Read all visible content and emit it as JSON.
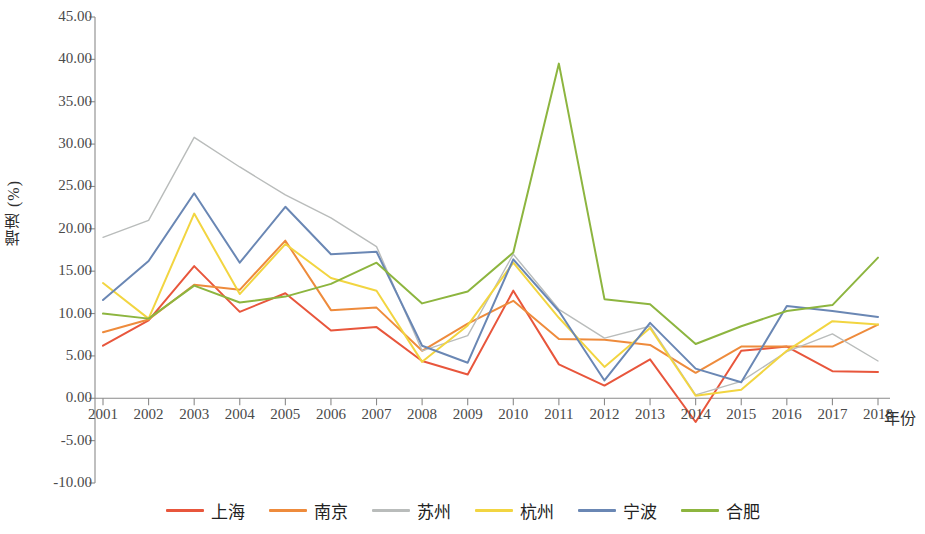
{
  "chart_data": {
    "type": "line",
    "title": "",
    "xlabel": "年份",
    "ylabel": "增速 (%)",
    "grid": false,
    "legend_position": "bottom",
    "xlim": [
      2001,
      2018
    ],
    "ylim": [
      -10,
      45
    ],
    "ytick_step": 5,
    "yticks": [
      "45.00",
      "40.00",
      "35.00",
      "30.00",
      "25.00",
      "20.00",
      "15.00",
      "10.00",
      "5.00",
      "0.00",
      "-5.00",
      "-10.00"
    ],
    "ytick_values": [
      45,
      40,
      35,
      30,
      25,
      20,
      15,
      10,
      5,
      0,
      -5,
      -10
    ],
    "categories": [
      "2001",
      "2002",
      "2003",
      "2004",
      "2005",
      "2006",
      "2007",
      "2008",
      "2009",
      "2010",
      "2011",
      "2012",
      "2013",
      "2014",
      "2015",
      "2016",
      "2017",
      "2018"
    ],
    "x": [
      2001,
      2002,
      2003,
      2004,
      2005,
      2006,
      2007,
      2008,
      2009,
      2010,
      2011,
      2012,
      2013,
      2014,
      2015,
      2016,
      2017,
      2018
    ],
    "series": [
      {
        "name": "上海",
        "color": "#E8563C",
        "values": [
          6.2,
          9.2,
          15.6,
          10.2,
          12.4,
          8.0,
          8.4,
          4.4,
          2.8,
          12.7,
          4.0,
          1.5,
          4.6,
          -2.8,
          5.6,
          6.1,
          3.2,
          3.1
        ]
      },
      {
        "name": "南京",
        "color": "#EE8B3C",
        "values": [
          7.8,
          9.3,
          13.4,
          12.8,
          18.6,
          10.4,
          10.7,
          5.6,
          8.8,
          11.5,
          7.0,
          6.9,
          6.3,
          3.0,
          6.1,
          6.1,
          6.1,
          8.7
        ]
      },
      {
        "name": "苏州",
        "color": "#B9BCBB",
        "values": [
          19.0,
          21.0,
          30.8,
          27.3,
          24.0,
          21.3,
          17.9,
          5.6,
          7.4,
          17.0,
          10.5,
          7.1,
          8.5,
          0.4,
          2.0,
          5.5,
          7.6,
          4.4
        ]
      },
      {
        "name": "杭州",
        "color": "#F2D541",
        "values": [
          13.6,
          9.4,
          21.8,
          12.3,
          18.2,
          14.2,
          12.7,
          4.3,
          8.6,
          16.0,
          9.5,
          3.7,
          8.3,
          0.3,
          1.0,
          5.6,
          9.1,
          8.7
        ]
      },
      {
        "name": "宁波",
        "color": "#6A87B4",
        "values": [
          11.6,
          16.2,
          24.2,
          16.0,
          22.6,
          17.0,
          17.3,
          6.2,
          4.2,
          16.4,
          10.3,
          2.1,
          8.9,
          3.5,
          1.9,
          10.9,
          10.3,
          9.6
        ]
      },
      {
        "name": "合肥",
        "color": "#8DB53F",
        "values": [
          10.0,
          9.4,
          13.3,
          11.3,
          12.0,
          13.5,
          16.0,
          11.2,
          12.6,
          17.2,
          39.5,
          11.7,
          11.1,
          6.4,
          8.5,
          10.3,
          11.0,
          16.6
        ]
      }
    ]
  },
  "legend": {
    "items": [
      {
        "label": "上海",
        "color": "#E8563C"
      },
      {
        "label": "南京",
        "color": "#EE8B3C"
      },
      {
        "label": "苏州",
        "color": "#B9BCBB"
      },
      {
        "label": "杭州",
        "color": "#F2D541"
      },
      {
        "label": "宁波",
        "color": "#6A87B4"
      },
      {
        "label": "合肥",
        "color": "#8DB53F"
      }
    ]
  },
  "axes": {
    "axis_color": "#8a8a8a",
    "tick_color": "#8a8a8a"
  }
}
